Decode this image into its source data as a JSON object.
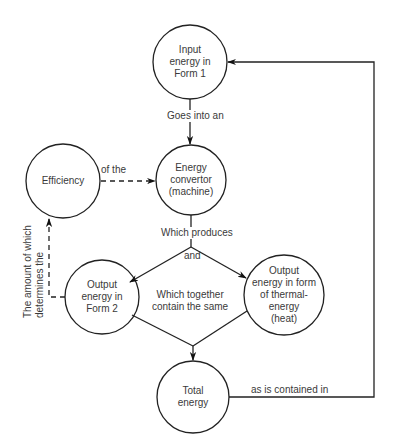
{
  "diagram": {
    "nodes": {
      "input": {
        "text": "Input\nenergy in\nForm 1"
      },
      "convertor": {
        "text": "Energy\nconvertor\n(machine)"
      },
      "efficiency": {
        "text": "Efficiency"
      },
      "output2": {
        "text": "Output\nenergy in\nForm 2"
      },
      "thermal": {
        "text": "Output\nenergy in form\nof thermal-\nenergy\n(heat)"
      },
      "total": {
        "text": "Total\nenergy"
      }
    },
    "edges": {
      "goes_into": "Goes into an",
      "of_the": "of the",
      "which_produces": "Which produces",
      "and": "and",
      "which_together": "Which together\ncontain the same",
      "as_contained": "as is contained in",
      "amount_determines": "The amount of which\ndetermines the"
    },
    "colors": {
      "stroke": "#222222",
      "text": "#3a3a3a",
      "background": "#ffffff"
    }
  }
}
